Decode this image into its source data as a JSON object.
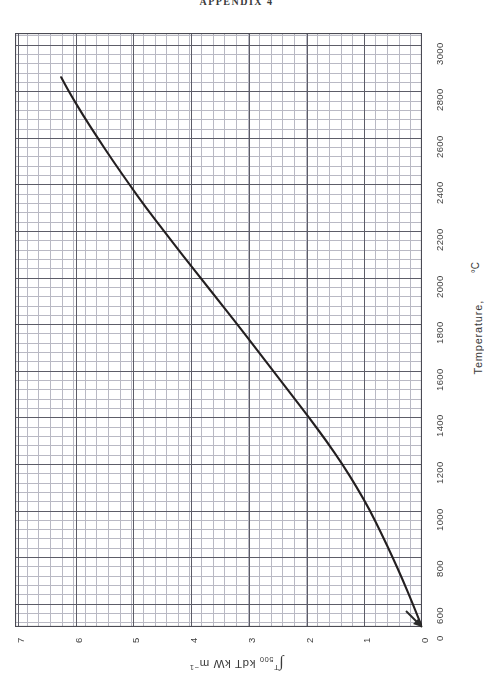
{
  "page": {
    "title": "APPENDIX 4",
    "background": "#ffffff",
    "ink_color": "#2a2a2a",
    "grid_minor_color": "#b9b9c4",
    "grid_major_color": "#5d5d68",
    "curve_color": "#231f20"
  },
  "chart_data": {
    "type": "line",
    "title": "APPENDIX 4",
    "orientation": "rotated-90",
    "xlabel": "Temperature,",
    "xunit": "°C",
    "ylabel_integral": "∫",
    "ylabel_sub": "500",
    "ylabel_sup": "T",
    "ylabel_rest": "kdT  kW m",
    "ylabel_exp": "−1",
    "ylabel_full": "∫(500..T) k dT   kW m⁻¹",
    "grid": true,
    "xlim": [
      500,
      3050
    ],
    "ylim": [
      0,
      7.05
    ],
    "x_major_step": 200,
    "y_major_step": 1,
    "x_tick_labels": [
      "600",
      "800",
      "1000",
      "1200",
      "1400",
      "1600",
      "1800",
      "2000",
      "2200",
      "2400",
      "2600",
      "2800",
      "3000"
    ],
    "x_tick_values": [
      600,
      800,
      1000,
      1200,
      1400,
      1600,
      1800,
      2000,
      2200,
      2400,
      2600,
      2800,
      3000
    ],
    "y_tick_labels": [
      "0",
      "1",
      "2",
      "3",
      "4",
      "5",
      "6",
      "7"
    ],
    "y_tick_values": [
      0,
      1,
      2,
      3,
      4,
      5,
      6,
      7
    ],
    "origin_label": "0",
    "legend": "none",
    "series": [
      {
        "name": "thermal conductivity integral",
        "x": [
          500,
          600,
          700,
          800,
          900,
          1000,
          1100,
          1200,
          1300,
          1400,
          1500,
          1600,
          1700,
          1800,
          1900,
          2000,
          2100,
          2200,
          2300,
          2400,
          2500,
          2600,
          2700,
          2800,
          2860
        ],
        "y": [
          0.0,
          0.16,
          0.33,
          0.51,
          0.7,
          0.9,
          1.13,
          1.38,
          1.66,
          1.96,
          2.27,
          2.58,
          2.89,
          3.2,
          3.52,
          3.84,
          4.16,
          4.47,
          4.78,
          5.07,
          5.35,
          5.62,
          5.88,
          6.12,
          6.25
        ]
      }
    ]
  }
}
